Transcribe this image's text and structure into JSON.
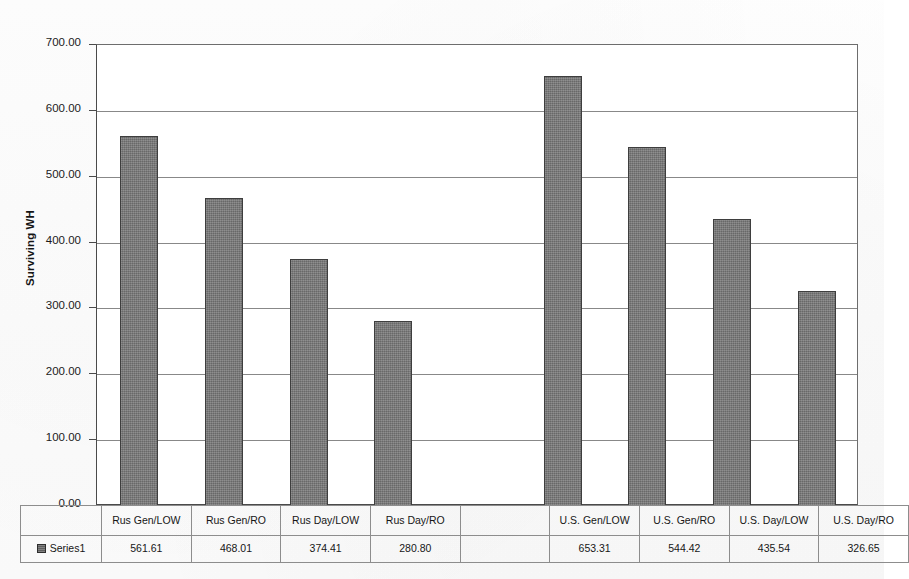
{
  "chart_data": {
    "type": "bar",
    "title": "",
    "xlabel": "",
    "ylabel": "Surviving WH",
    "ylim": [
      0,
      700
    ],
    "ytick_step": 100,
    "grid": true,
    "legend_position": "bottom-data-table",
    "series_name": "Series1",
    "categories": [
      "Rus Gen/LOW",
      "Rus Gen/RO",
      "Rus Day/LOW",
      "Rus Day/RO",
      "",
      "U.S. Gen/LOW",
      "U.S. Gen/RO",
      "U.S. Day/LOW",
      "U.S. Day/RO"
    ],
    "values": [
      561.61,
      468.01,
      374.41,
      280.8,
      null,
      653.31,
      544.42,
      435.54,
      326.65
    ],
    "value_labels": [
      "561.61",
      "468.01",
      "374.41",
      "280.80",
      "",
      "653.31",
      "544.42",
      "435.54",
      "326.65"
    ],
    "ytick_labels": [
      "700.00",
      "600.00",
      "500.00",
      "400.00",
      "300.00",
      "200.00",
      "100.00",
      "0.00"
    ],
    "ytick_values": [
      700,
      600,
      500,
      400,
      300,
      200,
      100,
      0
    ],
    "bar_color": "#777777",
    "bar_border_color": "#3e3e3e",
    "gridline_color": "#888888",
    "axis_color": "#4a4a4a"
  },
  "axis": {
    "y_title": "Surviving WH"
  },
  "table": {
    "legend_label": "Series1",
    "category_row": [
      "Rus Gen/LOW",
      "Rus Gen/RO",
      "Rus Day/LOW",
      "Rus Day/RO",
      "",
      "U.S. Gen/LOW",
      "U.S. Gen/RO",
      "U.S. Day/LOW",
      "U.S. Day/RO"
    ],
    "value_row": [
      "561.61",
      "468.01",
      "374.41",
      "280.80",
      "",
      "653.31",
      "544.42",
      "435.54",
      "326.65"
    ]
  },
  "icons": {
    "legend_marker": "series-swatch-icon"
  }
}
